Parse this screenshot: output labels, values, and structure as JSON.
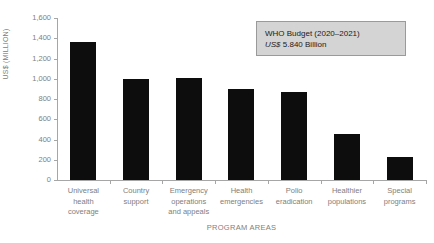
{
  "chart_data": {
    "type": "bar",
    "title": "",
    "xlabel": "PROGRAM AREAS",
    "ylabel": "US$ (MILLION)",
    "ylim": [
      0,
      1600
    ],
    "ytick_step": 200,
    "yticks": [
      "1,600",
      "1,400",
      "1,200",
      "1,000",
      "800",
      "600",
      "400",
      "200",
      "0"
    ],
    "ytick_values": [
      1600,
      1400,
      1200,
      1000,
      800,
      600,
      400,
      200,
      0
    ],
    "grid": false,
    "legend": null,
    "bar_color": "#0d0d0d",
    "categories": [
      "Universal health coverage",
      "Country support",
      "Emergency operations and appeals",
      "Health emergencies",
      "Polio eradication",
      "Healthier populations",
      "Special programs"
    ],
    "category_lines": [
      [
        "Universal",
        "health",
        "coverage"
      ],
      [
        "Country",
        "support"
      ],
      [
        "Emergency",
        "operations",
        "and appeals"
      ],
      [
        "Health",
        "emergencies"
      ],
      [
        "Polio",
        "eradication"
      ],
      [
        "Healthier",
        "populations"
      ],
      [
        "Special",
        "programs"
      ]
    ],
    "values": [
      1368,
      1000,
      1005,
      898,
      868,
      450,
      225
    ]
  },
  "annotation": {
    "line1": "WHO Budget (2020–2021)",
    "line2_prefix": "US$",
    "line2_rest": " 5.840 Billion",
    "box_fill": "#d4d4d4",
    "box_border": "#9a9a9a"
  }
}
